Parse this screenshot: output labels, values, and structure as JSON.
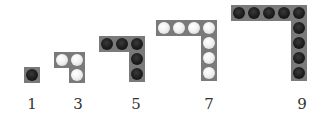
{
  "figure": {
    "cell_size": 16,
    "colors": {
      "frame": "#7a7a7a",
      "dark_counter": "#1c1c1c",
      "light_counter": "#f2f2f2",
      "label": "#333333"
    },
    "shapes": [
      {
        "label": "1",
        "count": 1,
        "arm": 1,
        "counter": "dark",
        "x": 24,
        "y": 67
      },
      {
        "label": "3",
        "count": 3,
        "arm": 2,
        "counter": "light",
        "x": 54,
        "y": 52
      },
      {
        "label": "5",
        "count": 5,
        "arm": 3,
        "counter": "dark",
        "x": 99,
        "y": 36
      },
      {
        "label": "7",
        "count": 7,
        "arm": 4,
        "counter": "light",
        "x": 156,
        "y": 20
      },
      {
        "label": "9",
        "count": 9,
        "arm": 5,
        "counter": "dark",
        "x": 231,
        "y": 5
      }
    ],
    "labels": [
      {
        "text": "1",
        "x": 22
      },
      {
        "text": "3",
        "x": 68
      },
      {
        "text": "5",
        "x": 126
      },
      {
        "text": "7",
        "x": 199
      },
      {
        "text": "9",
        "x": 292
      }
    ]
  }
}
